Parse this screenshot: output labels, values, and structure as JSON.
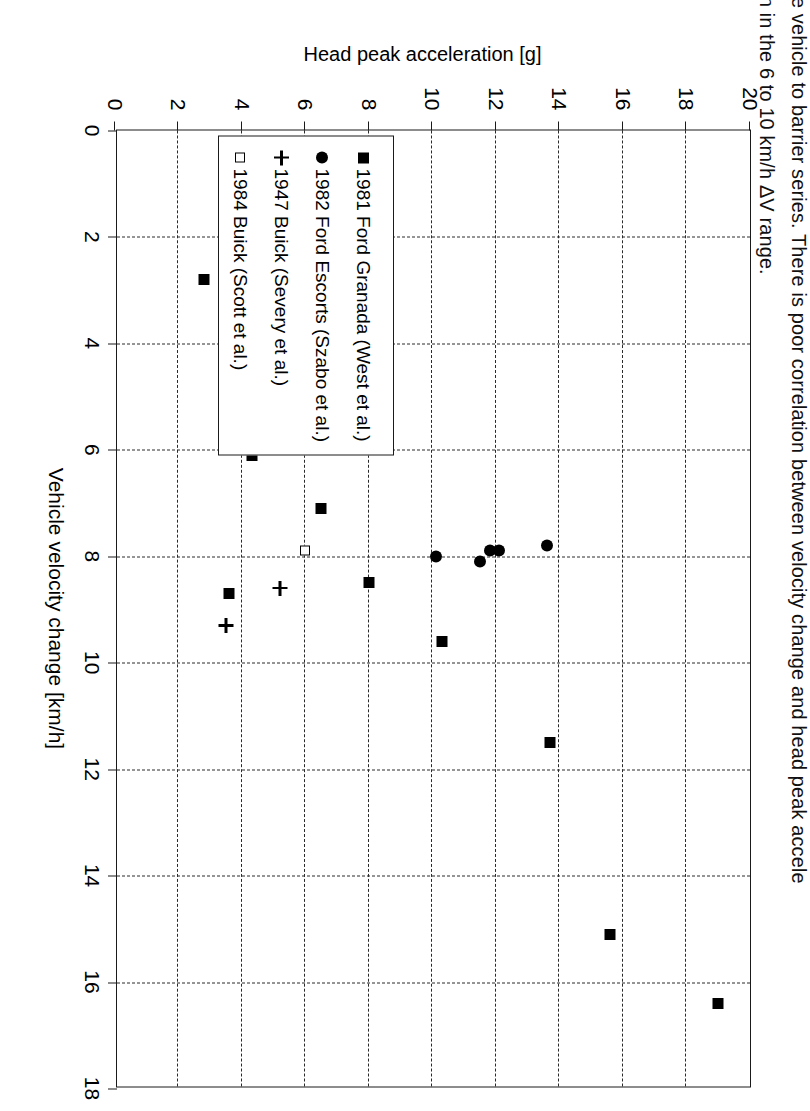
{
  "document": {
    "paragraph_line1": "one vehicle to barrier series. There is poor correlation between velocity change and head peak accele",
    "paragraph_line2": "tion in the 6 to 10 km/h ΔV range."
  },
  "chart_data": {
    "type": "scatter",
    "title": "",
    "xlabel": "Vehicle velocity change [km/h]",
    "ylabel": "Head peak acceleration [g]",
    "xlim": [
      0,
      18
    ],
    "ylim": [
      0,
      20
    ],
    "xticks": [
      0,
      2,
      4,
      6,
      8,
      10,
      12,
      14,
      16,
      18
    ],
    "yticks": [
      0,
      2,
      4,
      6,
      8,
      10,
      12,
      14,
      16,
      18,
      20
    ],
    "xtick_labels": [
      "0",
      "2",
      "4",
      "6",
      "8",
      "10",
      "12",
      "14",
      "16",
      "18"
    ],
    "ytick_labels": [
      "0",
      "2",
      "4",
      "6",
      "8",
      "10",
      "12",
      "14",
      "16",
      "18",
      "20"
    ],
    "grid": true,
    "grid_style": "dashed",
    "legend_position": "lower-left-inside",
    "series": [
      {
        "name": "1981 Ford Granada (West et al.)",
        "marker": "filled-square",
        "color": "#000000",
        "points": [
          {
            "x": 16.4,
            "y": 19.0
          },
          {
            "x": 15.1,
            "y": 15.6
          },
          {
            "x": 11.5,
            "y": 13.7
          },
          {
            "x": 9.6,
            "y": 10.3
          },
          {
            "x": 8.5,
            "y": 8.0
          },
          {
            "x": 7.1,
            "y": 6.5
          },
          {
            "x": 6.1,
            "y": 4.3
          },
          {
            "x": 8.7,
            "y": 3.6
          },
          {
            "x": 2.8,
            "y": 2.8
          }
        ]
      },
      {
        "name": "1982 Ford Escorts (Szabo et al.)",
        "marker": "filled-circle",
        "color": "#000000",
        "points": [
          {
            "x": 7.8,
            "y": 13.6
          },
          {
            "x": 7.9,
            "y": 12.1
          },
          {
            "x": 7.9,
            "y": 11.8
          },
          {
            "x": 8.1,
            "y": 11.5
          },
          {
            "x": 8.0,
            "y": 10.1
          }
        ]
      },
      {
        "name": "1947 Buick (Severy et al.)",
        "marker": "plus",
        "color": "#000000",
        "points": [
          {
            "x": 8.6,
            "y": 5.2
          },
          {
            "x": 9.3,
            "y": 3.5
          }
        ]
      },
      {
        "name": "1984 Buick (Scott et al.)",
        "marker": "open-square",
        "color": "#000000",
        "points": [
          {
            "x": 7.9,
            "y": 6.0
          }
        ]
      }
    ]
  }
}
